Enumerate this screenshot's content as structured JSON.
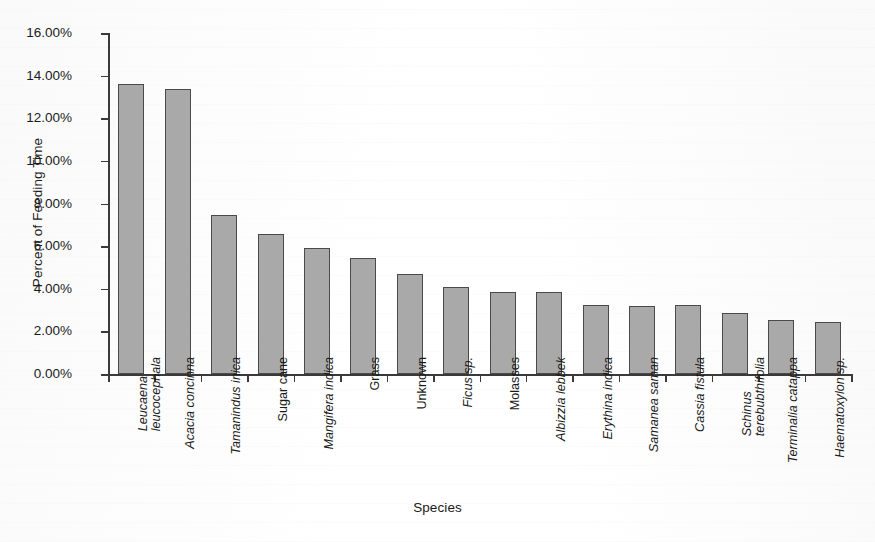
{
  "chart_data": {
    "type": "bar",
    "title": "",
    "xlabel": "Species",
    "ylabel": "Percent of Feeding Time",
    "ylim": [
      0,
      16
    ],
    "ytick_labels": [
      "16.00%",
      "14.00%",
      "12.00%",
      "10.00%",
      "8.00%",
      "6.00%",
      "4.00%",
      "2.00%",
      "0.00%"
    ],
    "ytick_values": [
      16,
      14,
      12,
      10,
      8,
      6,
      4,
      2,
      0
    ],
    "grid": false,
    "legend": "none",
    "bar_fill_color": "#a9a9a9",
    "bar_border_color": "#4a4a4a",
    "axis_color": "#3a3a3a",
    "background_color": "#ffffff",
    "categories": [
      "Leucaena\nleucocephala",
      "Acacia concinna",
      "Tamanindus inica",
      "Sugar cane",
      "Mangifera indica",
      "Grass",
      "Unknown",
      "Ficus sp.",
      "Molasses",
      "Albizzia lebbek",
      "Erythina indica",
      "Samanea saman",
      "Cassia fistula",
      "Schinus\nterebubthifolia",
      "Terminalia catappa",
      "Haematoxylon sp."
    ],
    "category_styles": [
      "italic",
      "italic",
      "italic",
      "upright",
      "italic",
      "upright",
      "upright",
      "italic",
      "upright",
      "italic",
      "italic",
      "italic",
      "italic",
      "italic",
      "italic",
      "italic"
    ],
    "values": [
      13.6,
      13.35,
      7.46,
      6.55,
      5.9,
      5.45,
      4.7,
      4.1,
      3.87,
      3.87,
      3.25,
      3.17,
      3.22,
      2.88,
      2.55,
      2.45
    ]
  }
}
